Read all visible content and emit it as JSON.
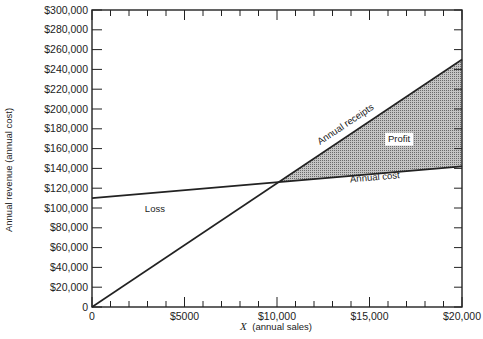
{
  "chart_data": {
    "type": "line",
    "title": "",
    "xlabel_var": "X",
    "xlabel": "(annual sales)",
    "ylabel": "Annual revenue (annual cost)",
    "xlim": [
      0,
      20000
    ],
    "ylim": [
      0,
      300000
    ],
    "grid": false,
    "x_tick_labels": [
      {
        "value": 0,
        "label": "0"
      },
      {
        "value": 5000,
        "label": "$5000"
      },
      {
        "value": 10000,
        "label": "$10,000"
      },
      {
        "value": 15000,
        "label": "$15,000"
      },
      {
        "value": 20000,
        "label": "$20,000"
      }
    ],
    "x_minor_tick_step": 1000,
    "y_tick_labels": [
      {
        "value": 0,
        "label": "0"
      },
      {
        "value": 20000,
        "label": "$20,000"
      },
      {
        "value": 40000,
        "label": "$40,000"
      },
      {
        "value": 60000,
        "label": "$60,000"
      },
      {
        "value": 80000,
        "label": "$80,000"
      },
      {
        "value": 100000,
        "label": "$100,000"
      },
      {
        "value": 120000,
        "label": "$120,000"
      },
      {
        "value": 140000,
        "label": "$140,000"
      },
      {
        "value": 160000,
        "label": "$160,000"
      },
      {
        "value": 180000,
        "label": "$180,000"
      },
      {
        "value": 200000,
        "label": "$200,000"
      },
      {
        "value": 220000,
        "label": "$220,000"
      },
      {
        "value": 240000,
        "label": "$240,000"
      },
      {
        "value": 260000,
        "label": "$260,000"
      },
      {
        "value": 280000,
        "label": "$280,000"
      },
      {
        "value": 300000,
        "label": "$300,000"
      }
    ],
    "series": [
      {
        "name": "Annual receipts",
        "x": [
          0,
          20000
        ],
        "y": [
          0,
          250000
        ]
      },
      {
        "name": "Annual cost",
        "x": [
          0,
          20000
        ],
        "y": [
          110000,
          142000
        ]
      }
    ],
    "break_even": {
      "x": 10100,
      "y": 126000
    },
    "annotations": [
      {
        "text": "Annual receipts",
        "x": 13800,
        "y": 182000
      },
      {
        "text": "Annual cost",
        "x": 15300,
        "y": 128000
      },
      {
        "text": "Profit",
        "x": 16600,
        "y": 167000
      },
      {
        "text": "Loss",
        "x": 3400,
        "y": 96000
      }
    ],
    "shaded_region": {
      "label": "Profit",
      "between": [
        "Annual receipts",
        "Annual cost"
      ],
      "from_x": 10100,
      "to_x": 20000,
      "fill": "#a8a8a8"
    }
  },
  "colors": {
    "line": "#222222",
    "shade": "#a8a8a8",
    "background": "#ffffff"
  }
}
